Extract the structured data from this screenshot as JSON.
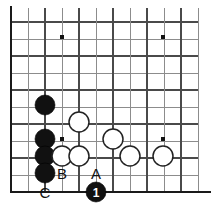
{
  "figure": {
    "board_size": 19,
    "geometry": {
      "origin_x": 11,
      "origin_y": 11,
      "spacing": 17,
      "cols_visible": 12,
      "rows_visible": 11,
      "stone_radius": 10,
      "left_edge_x": 11,
      "bottom_edge_y": 192
    },
    "colors": {
      "background": "#ffffff",
      "grid": "#8c8c8c",
      "grid_dark": "#4a4a4a",
      "edge": "#1a1a1a",
      "black_stone": "#111111",
      "white_stone": "#ffffff",
      "white_stone_outline": "#222222",
      "label_text": "#111111",
      "move_number_text": "#ffffff"
    }
  },
  "star_points": [
    {
      "name": "star-point-upper-left",
      "x": 62,
      "y": 37
    },
    {
      "name": "star-point-upper-right",
      "x": 163,
      "y": 37
    },
    {
      "name": "star-point-lower-left",
      "x": 62,
      "y": 139
    },
    {
      "name": "star-point-lower-right",
      "x": 163,
      "y": 139
    }
  ],
  "stones": [
    {
      "name": "black-stone-1",
      "color": "black",
      "x": 45,
      "y": 105
    },
    {
      "name": "black-stone-2",
      "color": "black",
      "x": 45,
      "y": 139
    },
    {
      "name": "black-stone-3",
      "color": "black",
      "x": 45,
      "y": 156
    },
    {
      "name": "black-stone-4",
      "color": "black",
      "x": 45,
      "y": 173
    },
    {
      "name": "white-stone-1",
      "color": "white",
      "x": 79,
      "y": 122
    },
    {
      "name": "white-stone-2",
      "color": "white",
      "x": 62,
      "y": 156
    },
    {
      "name": "white-stone-3",
      "color": "white",
      "x": 79,
      "y": 156
    },
    {
      "name": "white-stone-4",
      "color": "white",
      "x": 113,
      "y": 139
    },
    {
      "name": "white-stone-5",
      "color": "white",
      "x": 130,
      "y": 156
    },
    {
      "name": "white-stone-6",
      "color": "white",
      "x": 163,
      "y": 156
    }
  ],
  "numbered_stones": [
    {
      "name": "move-stone-1",
      "color": "black",
      "x": 96,
      "y": 192,
      "number": "1"
    }
  ],
  "point_labels": [
    {
      "name": "point-label-b",
      "text": "B",
      "x": 62,
      "y": 173
    },
    {
      "name": "point-label-a",
      "text": "A",
      "x": 96,
      "y": 173
    },
    {
      "name": "point-label-c",
      "text": "C",
      "x": 45,
      "y": 192
    }
  ]
}
